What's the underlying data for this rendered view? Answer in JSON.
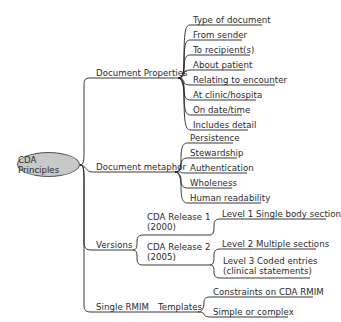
{
  "root": {
    "label": "CDA Principles",
    "fill": "#c8c8c8"
  },
  "branches": [
    {
      "label": "Document Properties",
      "children": [
        "Type of document",
        "From sender",
        "To recipient(s)",
        "About patient",
        "Relating to encounter",
        "At clinic/hospita",
        "On date/time",
        "Includes detail"
      ]
    },
    {
      "label": "Document metaphor",
      "children": [
        "Persistence",
        "Stewardship",
        "Authentication",
        "Wholeness",
        "Human readability"
      ]
    },
    {
      "label": "Versions",
      "children": [
        {
          "label_line1": "CDA Release 1",
          "label_line2": "(2000)",
          "children": [
            "Level 1 Single body section"
          ]
        },
        {
          "label_line1": "CDA Release 2",
          "label_line2": "(2005)",
          "children": [
            "Level 2 Multiple sections",
            {
              "line1": "Level 3 Coded entries",
              "line2": "(clinical statements)"
            }
          ]
        }
      ]
    },
    {
      "label": "Single RMIM",
      "children": [
        {
          "label": "Templates",
          "children": [
            "Constraints on CDA RMIM",
            "Simple or complex"
          ]
        }
      ]
    }
  ]
}
